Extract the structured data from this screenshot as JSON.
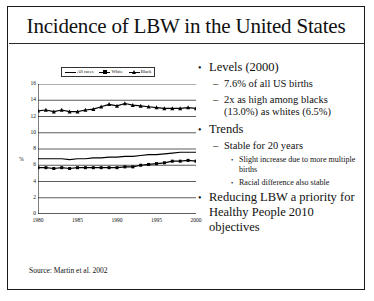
{
  "slide": {
    "title": "Incidence of LBW in the United States",
    "source": "Source: Martin et al. 2002"
  },
  "bullets": [
    {
      "level": 1,
      "marker": "•",
      "text": "Levels (2000)"
    },
    {
      "level": 2,
      "marker": "–",
      "text": "7.6% of all US births"
    },
    {
      "level": 2,
      "marker": "–",
      "text": "2x as high among blacks (13.0%) as whites (6.5%)"
    },
    {
      "level": 1,
      "marker": "•",
      "text": "Trends"
    },
    {
      "level": 2,
      "marker": "–",
      "text": "Stable for 20 years"
    },
    {
      "level": 3,
      "marker": "•",
      "text": "Slight increase due to more multiple births"
    },
    {
      "level": 3,
      "marker": "•",
      "text": "Racial difference also stable"
    },
    {
      "level": 1,
      "marker": "•",
      "text": "Reducing LBW a priority for Healthy People 2010 objectives"
    }
  ],
  "chart_data": {
    "type": "line",
    "title": "",
    "xlabel": "",
    "ylabel": "%",
    "xlim": [
      1980,
      2000
    ],
    "ylim": [
      0,
      16
    ],
    "yticks": [
      16,
      14,
      12,
      10,
      8,
      6,
      4,
      2,
      0
    ],
    "xticks": [
      1980,
      1985,
      1990,
      1995,
      2000
    ],
    "grid": true,
    "legend_position": "top",
    "x": [
      1980,
      1981,
      1982,
      1983,
      1984,
      1985,
      1986,
      1987,
      1988,
      1989,
      1990,
      1991,
      1992,
      1993,
      1994,
      1995,
      1996,
      1997,
      1998,
      1999,
      2000
    ],
    "series": [
      {
        "name": "All races",
        "marker": "none",
        "values": [
          6.8,
          6.8,
          6.8,
          6.8,
          6.7,
          6.8,
          6.8,
          6.9,
          6.9,
          7.0,
          7.0,
          7.1,
          7.1,
          7.2,
          7.3,
          7.3,
          7.4,
          7.5,
          7.6,
          7.6,
          7.6
        ]
      },
      {
        "name": "White",
        "marker": "square",
        "values": [
          5.7,
          5.7,
          5.6,
          5.7,
          5.6,
          5.7,
          5.7,
          5.7,
          5.7,
          5.7,
          5.7,
          5.8,
          5.8,
          6.0,
          6.1,
          6.2,
          6.3,
          6.5,
          6.5,
          6.6,
          6.5
        ]
      },
      {
        "name": "Black",
        "marker": "triangle",
        "values": [
          12.7,
          12.8,
          12.6,
          12.8,
          12.6,
          12.6,
          12.8,
          12.9,
          13.2,
          13.5,
          13.3,
          13.6,
          13.4,
          13.3,
          13.2,
          13.1,
          13.0,
          13.0,
          13.0,
          13.1,
          13.0
        ]
      }
    ]
  }
}
